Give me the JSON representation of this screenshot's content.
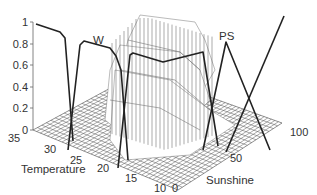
{
  "chart_data": {
    "type": "surface3d",
    "title": "",
    "xlabel": "Temperature",
    "ylabel": "Sunshine",
    "zlabel": "",
    "x_ticks": [
      "35",
      "30",
      "25",
      "20",
      "15",
      "10"
    ],
    "y_ticks": [
      "0",
      "50",
      "100"
    ],
    "z_ticks": [
      "0",
      "0.2",
      "0.4",
      "0.6",
      "0.8",
      "1"
    ],
    "x_range": [
      10,
      35
    ],
    "y_range": [
      0,
      100
    ],
    "z_range": [
      0,
      1
    ],
    "membership_functions": [
      {
        "name": "",
        "axis": "Temperature",
        "shape": "trapezoid",
        "points": [
          [
            35,
            1.0
          ],
          [
            29,
            0.8
          ],
          [
            27,
            0
          ]
        ]
      },
      {
        "name": "W",
        "axis": "Temperature",
        "shape": "trapezoid",
        "points": [
          [
            27,
            0
          ],
          [
            25,
            0.8
          ],
          [
            19,
            0.72
          ],
          [
            17,
            0
          ]
        ]
      },
      {
        "name": "",
        "axis": "Temperature",
        "shape": "trapezoid",
        "points": [
          [
            17,
            0
          ],
          [
            15,
            0.7
          ],
          [
            10,
            0.7
          ]
        ]
      },
      {
        "name": "PS",
        "axis": "Sunshine",
        "shape": "triangle",
        "points": [
          [
            30,
            0
          ],
          [
            50,
            0.8
          ],
          [
            100,
            0
          ]
        ]
      },
      {
        "name": "",
        "axis": "Sunshine",
        "shape": "ramp",
        "points": [
          [
            50,
            0
          ],
          [
            100,
            1.0
          ]
        ]
      }
    ],
    "annotations": [
      "W",
      "PS"
    ],
    "grid": true,
    "legend": null
  },
  "labels": {
    "temperature": "Temperature",
    "sunshine": "Sunshine",
    "w": "W",
    "ps": "PS"
  },
  "ticks": {
    "z": [
      "1",
      "0.8",
      "0.6",
      "0.4",
      "0.2",
      "0"
    ],
    "temperature": [
      "35",
      "30",
      "25",
      "20",
      "15",
      "10"
    ],
    "sunshine": [
      "0",
      "50",
      "100"
    ]
  }
}
